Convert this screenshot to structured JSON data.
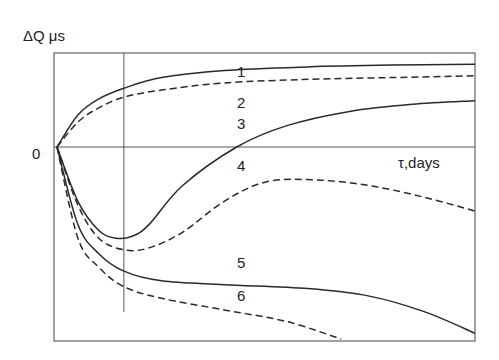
{
  "chart_data": {
    "type": "line",
    "title": "",
    "ylabel": "ΔQ μs",
    "xlabel": "τ,days",
    "origin_label": "0",
    "x_marker": 0.16,
    "xlim": [
      0,
      1
    ],
    "ylim": [
      -1,
      0.5
    ],
    "grid": false,
    "legend": "inline-labels",
    "series": [
      {
        "name": "1",
        "style": "solid",
        "x": [
          0,
          0.05,
          0.1,
          0.16,
          0.25,
          0.4,
          0.6,
          0.8,
          1.0
        ],
        "y": [
          0,
          0.18,
          0.27,
          0.33,
          0.39,
          0.43,
          0.45,
          0.46,
          0.465
        ]
      },
      {
        "name": "2",
        "style": "dashed",
        "x": [
          0,
          0.05,
          0.1,
          0.16,
          0.25,
          0.4,
          0.6,
          0.8,
          1.0
        ],
        "y": [
          0,
          0.14,
          0.22,
          0.28,
          0.32,
          0.36,
          0.38,
          0.39,
          0.4
        ]
      },
      {
        "name": "3",
        "style": "solid",
        "x": [
          0,
          0.05,
          0.1,
          0.14,
          0.18,
          0.22,
          0.3,
          0.43,
          0.55,
          0.7,
          0.85,
          1.0
        ],
        "y": [
          0,
          -0.28,
          -0.43,
          -0.47,
          -0.46,
          -0.4,
          -0.2,
          0,
          0.12,
          0.2,
          0.24,
          0.26
        ]
      },
      {
        "name": "4",
        "style": "dashed",
        "x": [
          0,
          0.05,
          0.1,
          0.16,
          0.22,
          0.3,
          0.4,
          0.5,
          0.62,
          0.75,
          0.88,
          1.0
        ],
        "y": [
          0,
          -0.3,
          -0.47,
          -0.53,
          -0.52,
          -0.44,
          -0.28,
          -0.18,
          -0.17,
          -0.2,
          -0.26,
          -0.33
        ]
      },
      {
        "name": "5",
        "style": "solid",
        "x": [
          0,
          0.05,
          0.1,
          0.16,
          0.25,
          0.4,
          0.6,
          0.75,
          0.88,
          1.0
        ],
        "y": [
          0,
          -0.4,
          -0.55,
          -0.64,
          -0.69,
          -0.71,
          -0.73,
          -0.77,
          -0.85,
          -0.96
        ]
      },
      {
        "name": "6",
        "style": "dashed",
        "x": [
          0,
          0.05,
          0.1,
          0.16,
          0.25,
          0.4,
          0.55,
          0.68
        ],
        "y": [
          0,
          -0.47,
          -0.62,
          -0.72,
          -0.78,
          -0.84,
          -0.9,
          -0.99
        ]
      }
    ],
    "annotations": [
      {
        "text": "1",
        "x": 0.44,
        "y": 0.42
      },
      {
        "text": "2",
        "x": 0.44,
        "y": 0.25
      },
      {
        "text": "3",
        "x": 0.44,
        "y": 0.13
      },
      {
        "text": "4",
        "x": 0.44,
        "y": -0.1
      },
      {
        "text": "5",
        "x": 0.44,
        "y": -0.6
      },
      {
        "text": "6",
        "x": 0.44,
        "y": -0.77
      }
    ]
  }
}
